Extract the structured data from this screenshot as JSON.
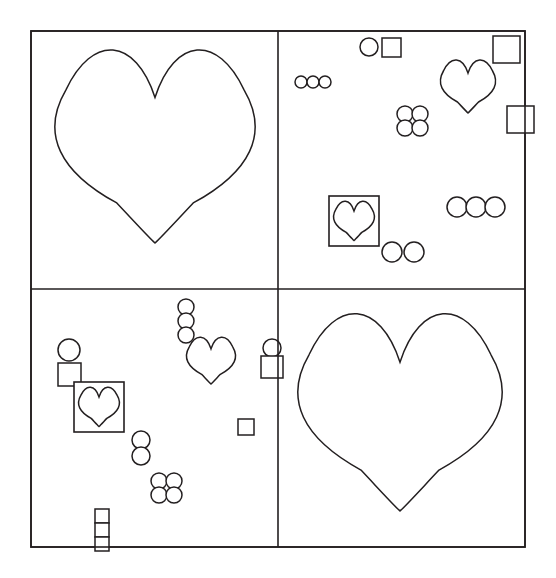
{
  "canvas": {
    "width": 556,
    "height": 578,
    "background_color": "#ffffff",
    "stroke_color": "#231f20",
    "fill": "none"
  },
  "figure": {
    "title": "",
    "frame": {
      "x": 31,
      "y": 31,
      "width": 494,
      "height": 516,
      "stroke_width": 1.6
    },
    "dividers": [
      {
        "name": "vertical-divider",
        "orientation": "vertical",
        "x": 278,
        "y1": 31,
        "y2": 547,
        "stroke_width": 1.6
      },
      {
        "name": "horizontal-divider",
        "orientation": "horizontal",
        "y": 289,
        "x1": 31,
        "x2": 525,
        "stroke_width": 1.6
      }
    ],
    "panels": [
      {
        "id": "top-left",
        "label": "Top Left Panel",
        "x": 31,
        "y": 31,
        "width": 247,
        "height": 258,
        "content_summary": "one large heart"
      },
      {
        "id": "top-right",
        "label": "Top Right Panel",
        "x": 278,
        "y": 31,
        "width": 247,
        "height": 258,
        "content_summary": "scattered small shapes, one medium heart, one boxed heart"
      },
      {
        "id": "bottom-left",
        "label": "Bottom Left Panel",
        "x": 31,
        "y": 289,
        "width": 247,
        "height": 258,
        "content_summary": "scattered small shapes, one medium heart, one boxed heart"
      },
      {
        "id": "bottom-right",
        "label": "Bottom Right Panel",
        "x": 278,
        "y": 289,
        "width": 247,
        "height": 258,
        "content_summary": "one large heart"
      }
    ]
  },
  "chart_data": {
    "type": "scatter",
    "title": "",
    "xlabel": "",
    "ylabel": "",
    "grid": true,
    "legend": "none",
    "xlim": [
      31,
      525
    ],
    "ylim": [
      31,
      547
    ],
    "shape_counts": {
      "hearts_large": 2,
      "hearts_medium": 2,
      "hearts_boxed": 2,
      "circles": 24,
      "squares": 10
    },
    "shapes": [
      {
        "panel": "top-left",
        "kind": "heart",
        "size": "large",
        "cx": 155,
        "cy": 152,
        "w": 196,
        "h": 182
      },
      {
        "panel": "top-right",
        "kind": "circle",
        "size": "small",
        "cx": 369,
        "cy": 47,
        "r": 9
      },
      {
        "panel": "top-right",
        "kind": "square",
        "size": "small",
        "x": 382,
        "y": 38,
        "w": 19,
        "h": 19
      },
      {
        "panel": "top-right",
        "kind": "square",
        "size": "medium",
        "x": 493,
        "y": 36,
        "w": 27,
        "h": 27,
        "note": "crosses right frame edge"
      },
      {
        "panel": "top-right",
        "kind": "circle",
        "size": "tiny",
        "cx": 301,
        "cy": 82,
        "r": 6
      },
      {
        "panel": "top-right",
        "kind": "circle",
        "size": "tiny",
        "cx": 313,
        "cy": 82,
        "r": 6
      },
      {
        "panel": "top-right",
        "kind": "circle",
        "size": "tiny",
        "cx": 325,
        "cy": 82,
        "r": 6
      },
      {
        "panel": "top-right",
        "kind": "heart",
        "size": "medium",
        "cx": 468,
        "cy": 88,
        "w": 54,
        "h": 50
      },
      {
        "panel": "top-right",
        "kind": "square",
        "size": "medium",
        "x": 507,
        "y": 106,
        "w": 27,
        "h": 27,
        "note": "crosses right frame edge"
      },
      {
        "panel": "top-right",
        "kind": "circle",
        "size": "small",
        "cx": 405,
        "cy": 114,
        "r": 8
      },
      {
        "panel": "top-right",
        "kind": "circle",
        "size": "small",
        "cx": 420,
        "cy": 114,
        "r": 8
      },
      {
        "panel": "top-right",
        "kind": "circle",
        "size": "small",
        "cx": 405,
        "cy": 128,
        "r": 8
      },
      {
        "panel": "top-right",
        "kind": "circle",
        "size": "small",
        "cx": 420,
        "cy": 128,
        "r": 8
      },
      {
        "panel": "top-right",
        "kind": "boxed-heart",
        "x": 329,
        "y": 196,
        "w": 50,
        "h": 50
      },
      {
        "panel": "top-right",
        "kind": "circle",
        "size": "small",
        "cx": 457,
        "cy": 207,
        "r": 10
      },
      {
        "panel": "top-right",
        "kind": "circle",
        "size": "small",
        "cx": 476,
        "cy": 207,
        "r": 10
      },
      {
        "panel": "top-right",
        "kind": "circle",
        "size": "small",
        "cx": 495,
        "cy": 207,
        "r": 10
      },
      {
        "panel": "top-right",
        "kind": "circle",
        "size": "small",
        "cx": 392,
        "cy": 252,
        "r": 10
      },
      {
        "panel": "top-right",
        "kind": "circle",
        "size": "small",
        "cx": 414,
        "cy": 252,
        "r": 10
      },
      {
        "panel": "bottom-left",
        "kind": "circle",
        "size": "small",
        "cx": 186,
        "cy": 307,
        "r": 8
      },
      {
        "panel": "bottom-left",
        "kind": "circle",
        "size": "small",
        "cx": 186,
        "cy": 321,
        "r": 8
      },
      {
        "panel": "bottom-left",
        "kind": "circle",
        "size": "small",
        "cx": 186,
        "cy": 335,
        "r": 8
      },
      {
        "panel": "bottom-left",
        "kind": "circle",
        "size": "medium",
        "cx": 69,
        "cy": 350,
        "r": 11
      },
      {
        "panel": "bottom-left",
        "kind": "circle",
        "size": "small",
        "cx": 272,
        "cy": 348,
        "r": 9,
        "note": "crosses vertical divider"
      },
      {
        "panel": "bottom-left",
        "kind": "heart",
        "size": "medium",
        "cx": 211,
        "cy": 362,
        "w": 48,
        "h": 44
      },
      {
        "panel": "bottom-left",
        "kind": "square",
        "size": "small",
        "x": 58,
        "y": 363,
        "w": 23,
        "h": 23
      },
      {
        "panel": "bottom-left",
        "kind": "square",
        "size": "small",
        "x": 261,
        "y": 356,
        "w": 22,
        "h": 22,
        "note": "crosses vertical divider"
      },
      {
        "panel": "bottom-left",
        "kind": "boxed-heart",
        "x": 74,
        "y": 382,
        "w": 50,
        "h": 50
      },
      {
        "panel": "bottom-left",
        "kind": "square",
        "size": "tiny",
        "x": 238,
        "y": 419,
        "w": 16,
        "h": 16
      },
      {
        "panel": "bottom-left",
        "kind": "circle",
        "size": "small",
        "cx": 141,
        "cy": 440,
        "r": 9
      },
      {
        "panel": "bottom-left",
        "kind": "circle",
        "size": "small",
        "cx": 141,
        "cy": 456,
        "r": 9
      },
      {
        "panel": "bottom-left",
        "kind": "circle",
        "size": "small",
        "cx": 159,
        "cy": 481,
        "r": 8
      },
      {
        "panel": "bottom-left",
        "kind": "circle",
        "size": "small",
        "cx": 174,
        "cy": 481,
        "r": 8
      },
      {
        "panel": "bottom-left",
        "kind": "circle",
        "size": "small",
        "cx": 159,
        "cy": 495,
        "r": 8
      },
      {
        "panel": "bottom-left",
        "kind": "circle",
        "size": "small",
        "cx": 174,
        "cy": 495,
        "r": 8
      },
      {
        "panel": "bottom-left",
        "kind": "square",
        "size": "tiny",
        "x": 95,
        "y": 509,
        "w": 14,
        "h": 14
      },
      {
        "panel": "bottom-left",
        "kind": "square",
        "size": "tiny",
        "x": 95,
        "y": 523,
        "w": 14,
        "h": 14
      },
      {
        "panel": "bottom-left",
        "kind": "square",
        "size": "tiny",
        "x": 95,
        "y": 537,
        "w": 14,
        "h": 14,
        "note": "crosses bottom frame edge"
      },
      {
        "panel": "bottom-right",
        "kind": "heart",
        "size": "large",
        "cx": 400,
        "cy": 418,
        "w": 200,
        "h": 186
      }
    ]
  }
}
